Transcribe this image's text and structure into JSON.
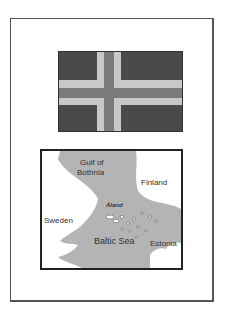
{
  "page": {
    "background": "#ffffff",
    "frame_border_color": "#555555"
  },
  "flag": {
    "description": "Nordic cross flag (grayscale)",
    "field_color": "#4a4a4a",
    "outer_cross_color": "#c8c8c8",
    "inner_cross_color": "#7a7a7a"
  },
  "map": {
    "water_color": "#b4b4b4",
    "land_color": "#ffffff",
    "labels": {
      "gulf": "Gulf of Bothnia",
      "gulf_line1": "Gulf of",
      "gulf_line2": "Bothnia",
      "finland": "Finland",
      "sweden": "Sweden",
      "baltic": "Baltic Sea",
      "estonia": "Estonia",
      "aland": "Åland"
    }
  }
}
